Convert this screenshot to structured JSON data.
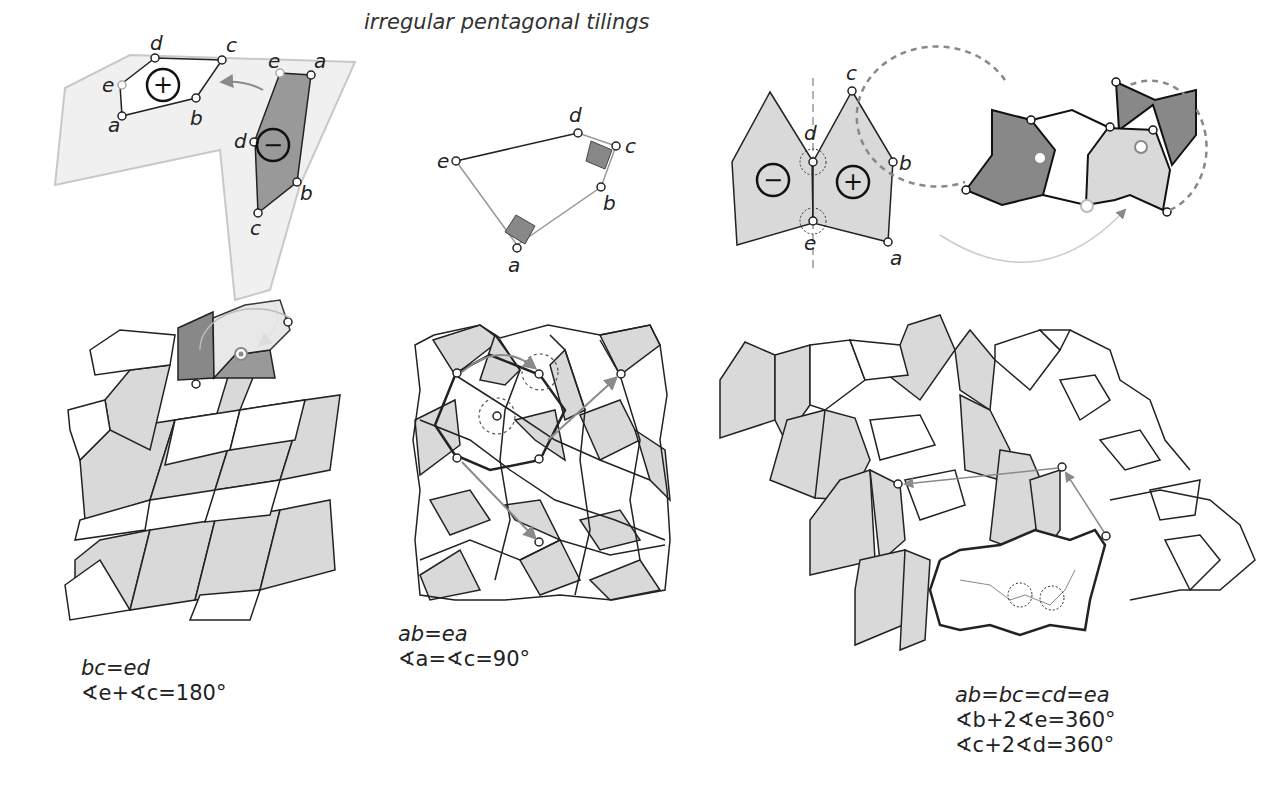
{
  "title": "irregular pentagonal tilings",
  "panels": [
    {
      "id": "type-a",
      "vertex_labels": [
        "a",
        "b",
        "c",
        "d",
        "e"
      ],
      "mirror_labels": [
        "a",
        "b",
        "c",
        "d",
        "e"
      ],
      "symbols": [
        "plus-rotation",
        "minus-rotation"
      ],
      "caption": {
        "line1": "bc=ed",
        "line2": "∢e+∢c=180°"
      }
    },
    {
      "id": "type-b",
      "vertex_labels": [
        "a",
        "b",
        "c",
        "d",
        "e"
      ],
      "caption": {
        "line1": "ab=ea",
        "line2": "∢a=∢c=90°"
      }
    },
    {
      "id": "type-c",
      "vertex_labels": [
        "a",
        "b",
        "c",
        "d",
        "e"
      ],
      "symbols": [
        "minus-rotation",
        "plus-rotation"
      ],
      "caption": {
        "line1": "ab=bc=cd=ea",
        "line2": "∢b+2∢e=360°",
        "line3": "∢c+2∢d=360°"
      }
    }
  ],
  "colors": {
    "tile_light": "#d9d9d9",
    "tile_dark": "#8f8f8f",
    "stroke": "#222222",
    "arrow": "#8a8a8a",
    "frame": "#c8c8c8"
  }
}
